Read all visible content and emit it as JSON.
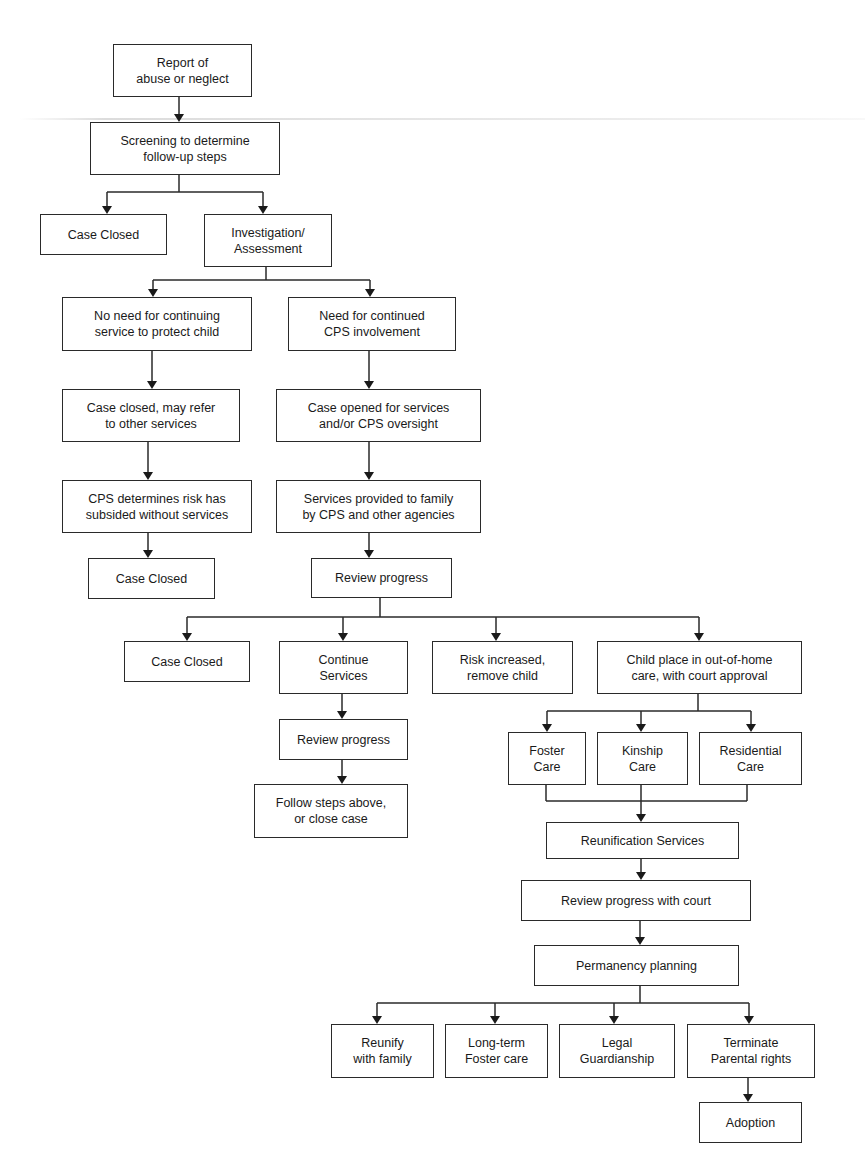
{
  "diagram": {
    "type": "flowchart",
    "title": "",
    "nodes": [
      {
        "id": "report",
        "label": "Report of\nabuse or neglect"
      },
      {
        "id": "screening",
        "label": "Screening to determine\nfollow-up steps"
      },
      {
        "id": "closed1",
        "label": "Case Closed"
      },
      {
        "id": "investigation",
        "label": "Investigation/\nAssessment"
      },
      {
        "id": "no_need",
        "label": "No need for continuing\nservice to protect child"
      },
      {
        "id": "need",
        "label": "Need for continued\nCPS involvement"
      },
      {
        "id": "closed_refer",
        "label": "Case closed, may refer\nto other services"
      },
      {
        "id": "case_opened",
        "label": "Case opened for services\nand/or CPS oversight"
      },
      {
        "id": "risk_subsided",
        "label": "CPS determines risk has\nsubsided without services"
      },
      {
        "id": "services_provided",
        "label": "Services provided to family\nby CPS and other agencies"
      },
      {
        "id": "closed2",
        "label": "Case Closed"
      },
      {
        "id": "review1",
        "label": "Review progress"
      },
      {
        "id": "closed3",
        "label": "Case Closed"
      },
      {
        "id": "continue",
        "label": "Continue\nServices"
      },
      {
        "id": "risk_increased",
        "label": "Risk increased,\nremove child"
      },
      {
        "id": "out_of_home",
        "label": "Child place in out-of-home\ncare, with court approval"
      },
      {
        "id": "review2",
        "label": "Review progress"
      },
      {
        "id": "follow_steps",
        "label": "Follow steps above,\nor close case"
      },
      {
        "id": "foster",
        "label": "Foster\nCare"
      },
      {
        "id": "kinship",
        "label": "Kinship\nCare"
      },
      {
        "id": "residential",
        "label": "Residential\nCare"
      },
      {
        "id": "reunification",
        "label": "Reunification Services"
      },
      {
        "id": "review_court",
        "label": "Review progress with court"
      },
      {
        "id": "permanency",
        "label": "Permanency planning"
      },
      {
        "id": "reunify",
        "label": "Reunify\nwith family"
      },
      {
        "id": "longterm",
        "label": "Long-term\nFoster care"
      },
      {
        "id": "guardianship",
        "label": "Legal\nGuardianship"
      },
      {
        "id": "terminate",
        "label": "Terminate\nParental rights"
      },
      {
        "id": "adoption",
        "label": "Adoption"
      }
    ],
    "edges": [
      [
        "report",
        "screening"
      ],
      [
        "screening",
        "closed1"
      ],
      [
        "screening",
        "investigation"
      ],
      [
        "investigation",
        "no_need"
      ],
      [
        "investigation",
        "need"
      ],
      [
        "no_need",
        "closed_refer"
      ],
      [
        "closed_refer",
        "risk_subsided"
      ],
      [
        "risk_subsided",
        "closed2"
      ],
      [
        "need",
        "case_opened"
      ],
      [
        "case_opened",
        "services_provided"
      ],
      [
        "services_provided",
        "review1"
      ],
      [
        "review1",
        "closed3"
      ],
      [
        "review1",
        "continue"
      ],
      [
        "review1",
        "risk_increased"
      ],
      [
        "review1",
        "out_of_home"
      ],
      [
        "continue",
        "review2"
      ],
      [
        "review2",
        "follow_steps"
      ],
      [
        "out_of_home",
        "foster"
      ],
      [
        "out_of_home",
        "kinship"
      ],
      [
        "out_of_home",
        "residential"
      ],
      [
        "foster",
        "reunification"
      ],
      [
        "kinship",
        "reunification"
      ],
      [
        "residential",
        "reunification"
      ],
      [
        "reunification",
        "review_court"
      ],
      [
        "review_court",
        "permanency"
      ],
      [
        "permanency",
        "reunify"
      ],
      [
        "permanency",
        "longterm"
      ],
      [
        "permanency",
        "guardianship"
      ],
      [
        "permanency",
        "terminate"
      ],
      [
        "terminate",
        "adoption"
      ]
    ]
  }
}
